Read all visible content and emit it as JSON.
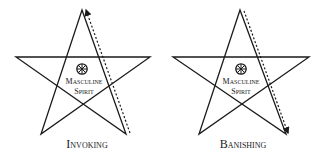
{
  "diagrams": [
    {
      "title": "Invoking",
      "center_label_line1": "Masculine",
      "center_label_line2": "Spirit",
      "center_symbol": "eight-spoked-wheel",
      "trace_direction": "from lower-right point up to top point"
    },
    {
      "title": "Banishing",
      "center_label_line1": "Masculine",
      "center_label_line2": "Spirit",
      "center_symbol": "eight-spoked-wheel",
      "trace_direction": "from top point down to lower-right point"
    }
  ],
  "colors": {
    "ink": "#1a1a1a",
    "background": "#ffffff"
  }
}
